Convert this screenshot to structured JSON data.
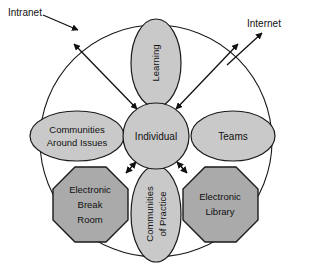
{
  "diagram": {
    "boundary": {
      "name": "organizational-boundary-circle",
      "shape": "circle"
    },
    "external_labels": [
      {
        "id": "intranet",
        "text": "Intranet",
        "direction": "inward"
      },
      {
        "id": "internet",
        "text": "Internet",
        "direction": "outward"
      }
    ],
    "center_node": {
      "id": "individual",
      "text": "Individual",
      "shape": "circle"
    },
    "nodes": [
      {
        "id": "learning",
        "text": "Learning",
        "shape": "ellipse",
        "orientation": "vertical",
        "position": "top"
      },
      {
        "id": "communities-around-issues",
        "line1": "Communities",
        "line2": "Around Issues",
        "shape": "ellipse",
        "orientation": "horizontal",
        "position": "left"
      },
      {
        "id": "teams",
        "text": "Teams",
        "shape": "ellipse",
        "orientation": "horizontal",
        "position": "right"
      },
      {
        "id": "electronic-break-room",
        "line1": "Electronic",
        "line2": "Break",
        "line3": "Room",
        "shape": "octagon",
        "position": "bottom-left"
      },
      {
        "id": "communities-of-practice",
        "line1": "Communities",
        "line2": "of Practice",
        "shape": "ellipse",
        "orientation": "vertical",
        "position": "bottom"
      },
      {
        "id": "electronic-library",
        "line1": "Electronic",
        "line2": "Library",
        "shape": "octagon",
        "position": "bottom-right"
      }
    ],
    "colors": {
      "node_fill": "#c9c9c9",
      "octagon_fill": "#aaaaaa",
      "stroke": "#1a1a1a",
      "background": "#ffffff",
      "text": "#111111"
    }
  }
}
